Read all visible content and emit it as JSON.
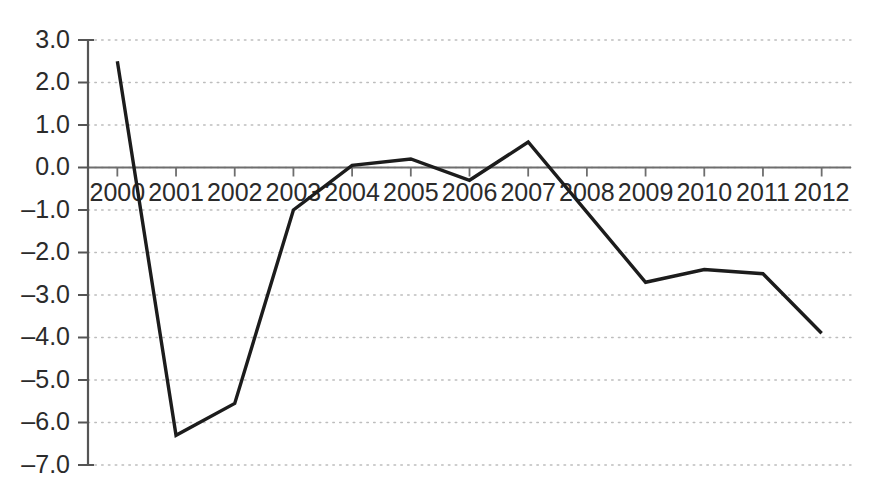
{
  "chart_data": {
    "type": "line",
    "title": "",
    "subtitle": "",
    "xlabel": "",
    "ylabel": "",
    "categories": [
      "2000",
      "2001",
      "2002",
      "2003",
      "2004",
      "2005",
      "2006",
      "2007",
      "2008",
      "2009",
      "2010",
      "2011",
      "2012"
    ],
    "values": [
      2.5,
      -6.3,
      -5.55,
      -1.0,
      0.05,
      0.2,
      -0.3,
      0.6,
      -1.05,
      -2.7,
      -2.4,
      -2.5,
      -3.9
    ],
    "series": [
      {
        "name": "series-1",
        "values": [
          2.5,
          -6.3,
          -5.55,
          -1.0,
          0.05,
          0.2,
          -0.3,
          0.6,
          -1.05,
          -2.7,
          -2.4,
          -2.5,
          -3.9
        ]
      }
    ],
    "ylim": [
      -7.0,
      3.0
    ],
    "ytick_values": [
      3.0,
      2.0,
      1.0,
      0.0,
      -1.0,
      -2.0,
      -3.0,
      -4.0,
      -5.0,
      -6.0,
      -7.0
    ],
    "ytick_labels": [
      "3.0",
      "2.0",
      "1.0",
      "0.0",
      "–1.0",
      "–2.0",
      "–3.0",
      "–4.0",
      "–5.0",
      "–6.0",
      "–7.0"
    ],
    "xtick_labels": [
      "2000",
      "2001",
      "2002",
      "2003",
      "2004",
      "2005",
      "2006",
      "2007",
      "2008",
      "2009",
      "2010",
      "2011",
      "2012"
    ],
    "grid": true,
    "grid_style": "dotted-horizontal",
    "legend": false,
    "legend_position": "none",
    "zero_line": true,
    "xaxis_label_position": "below-zero-line",
    "annotations": []
  },
  "style": {
    "line_color": "#1c1c1c",
    "grid_color": "#bdbdbd",
    "axis_color": "#555555",
    "zero_line_color": "#6e6e6e",
    "text_color": "#2b2b2b",
    "background": "#ffffff"
  }
}
